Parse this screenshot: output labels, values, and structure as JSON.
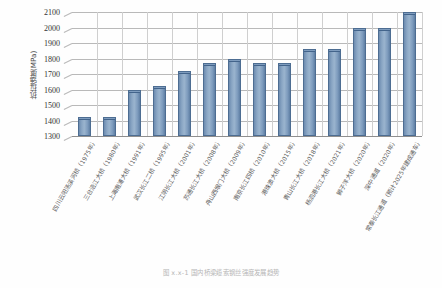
{
  "figure": {
    "caption": "图 x.x-1  国内桥梁缆索钢丝强度发展趋势"
  },
  "axis": {
    "y_title": "抗拉强度(MPa)",
    "y_ticks": [
      "2100",
      "2000",
      "1900",
      "1800",
      "1700",
      "1600",
      "1500",
      "1400",
      "1300"
    ]
  },
  "chart_data": {
    "type": "bar",
    "title": "",
    "xlabel": "",
    "ylabel": "抗拉强度(MPa)",
    "ylim": [
      1300,
      2100
    ],
    "ytick_step": 100,
    "grid": true,
    "legend": "none",
    "series_color": "#8aa6c4",
    "categories": [
      "四川云阳汤溪河桥（1975年）",
      "三台涪江大桥（1980年）",
      "上海南浦大桥（1991年）",
      "武汉长江二桥（1995年）",
      "江阴长江大桥（2001年）",
      "苏通长江大桥（2008年）",
      "舟山西堠门大桥（2009年）",
      "南京长江四桥（2010年）",
      "港珠澳大桥（2015年）",
      "青山长江大桥（2018年）",
      "杨泗港长江大桥（2021年）",
      "狮子洋大桥（2020年）",
      "深中通道（2020年）",
      "常泰长江通道（预计2025年建成通车）"
    ],
    "values": [
      1420,
      1420,
      1600,
      1620,
      1720,
      1770,
      1800,
      1770,
      1770,
      1860,
      1860,
      2000,
      2000,
      2100
    ]
  }
}
